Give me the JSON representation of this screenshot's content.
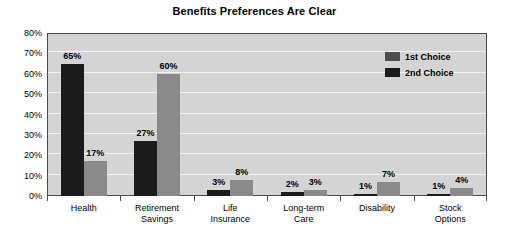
{
  "chart_data": {
    "type": "bar",
    "title": "Benefits Preferences Are Clear",
    "xlabel": "",
    "ylabel": "",
    "ylim": [
      0,
      80
    ],
    "ytick_labels": [
      "80%",
      "70%",
      "60%",
      "50%",
      "40%",
      "30%",
      "20%",
      "10%",
      "0%"
    ],
    "ytick_values": [
      80,
      70,
      60,
      50,
      40,
      30,
      20,
      10,
      0
    ],
    "grid": true,
    "legend_position": "top-right-inside",
    "categories": [
      "Health",
      "Retirement Savings",
      "Life Insurance",
      "Long-term Care",
      "Disability",
      "Stock Options"
    ],
    "category_lines": [
      [
        "Health"
      ],
      [
        "Retirement",
        "Savings"
      ],
      [
        "Life",
        "Insurance"
      ],
      [
        "Long-term",
        "Care"
      ],
      [
        "Disability"
      ],
      [
        "Stock",
        "Options"
      ]
    ],
    "series": [
      {
        "name": "1st Choice",
        "color": "#1b1b1b",
        "values": [
          65,
          27,
          3,
          2,
          1,
          1
        ],
        "data_labels": [
          "65%",
          "27%",
          "3%",
          "2%",
          "1%",
          "1%"
        ]
      },
      {
        "name": "2nd Choice",
        "color": "#8a8a8a",
        "values": [
          17,
          60,
          8,
          3,
          7,
          4
        ],
        "data_labels": [
          "17%",
          "60%",
          "8%",
          "3%",
          "7%",
          "4%"
        ]
      }
    ]
  },
  "legend": {
    "entries": [
      {
        "label": "1st Choice"
      },
      {
        "label": "2nd Choice"
      }
    ]
  },
  "colors": {
    "series_1st_choice": "#1b1b1b",
    "series_2nd_choice": "#8a8a8a",
    "plot_background": "#d4d4d4",
    "gridline": "#f2f2f2",
    "axis": "#4a4a4a",
    "text": "#000000",
    "page_background": "#ffffff"
  }
}
